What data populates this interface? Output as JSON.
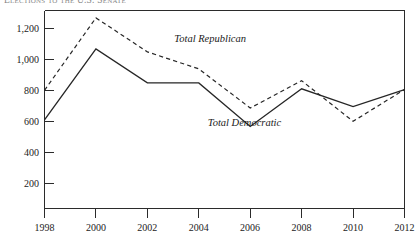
{
  "chart_data": {
    "type": "line",
    "title": "Elections to the U.S. Senate",
    "xlabel": "",
    "ylabel": "",
    "x": [
      1998,
      2000,
      2002,
      2004,
      2006,
      2008,
      2010,
      2012
    ],
    "xtick_labels": [
      "1998",
      "2000",
      "2002",
      "2004",
      "2006",
      "2008",
      "2010",
      "2012"
    ],
    "ytick_labels": [
      "200",
      "400",
      "600",
      "800",
      "1,000",
      "1,200"
    ],
    "ytick_values": [
      200,
      400,
      600,
      800,
      1000,
      1200
    ],
    "xlim": [
      1998,
      2012
    ],
    "ylim": [
      0,
      1340
    ],
    "grid": false,
    "legend_position": "inline-annotations",
    "series": [
      {
        "name": "Total Republican",
        "style": "dashed",
        "color": "#262626",
        "annotation": "Total Republican",
        "values": [
          800,
          1290,
          1060,
          945,
          680,
          865,
          590,
          805
        ]
      },
      {
        "name": "Total Democratic",
        "style": "solid",
        "color": "#262626",
        "annotation": "Total Democratic",
        "values": [
          600,
          1080,
          850,
          850,
          555,
          810,
          690,
          805
        ]
      }
    ],
    "annotations": [
      {
        "text": "Total Republican",
        "x": 2003.05,
        "y": 1130
      },
      {
        "text": "Total Democratic",
        "x": 2004.35,
        "y": 560
      }
    ]
  }
}
